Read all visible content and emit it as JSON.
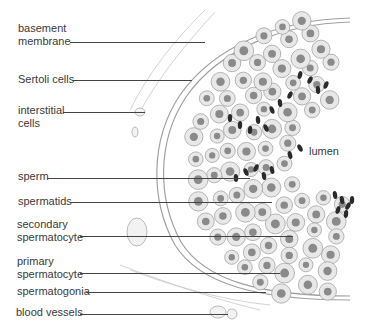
{
  "figure": {
    "labels": [
      {
        "id": "basement-membrane",
        "lines": [
          "basement",
          "membrane"
        ],
        "x": 18,
        "y": 22,
        "line_y": 42,
        "line_x1": 70,
        "line_x2": 205
      },
      {
        "id": "sertoli-cells",
        "lines": [
          "Sertoli cells"
        ],
        "x": 18,
        "y": 73,
        "line_y": 80,
        "line_x1": 72,
        "line_x2": 192
      },
      {
        "id": "interstitial-cells",
        "lines": [
          "interstitial",
          "cells"
        ],
        "x": 18,
        "y": 104,
        "line_y": 112,
        "line_x1": 63,
        "line_x2": 145
      },
      {
        "id": "sperm",
        "lines": [
          "sperm"
        ],
        "x": 18,
        "y": 170,
        "line_y": 178,
        "line_x1": 47,
        "line_x2": 250
      },
      {
        "id": "spermatids",
        "lines": [
          "spermatids"
        ],
        "x": 18,
        "y": 195,
        "line_y": 202,
        "line_x1": 70,
        "line_x2": 272
      },
      {
        "id": "secondary-spermatocyte",
        "lines": [
          "secondary",
          "spermatocyte"
        ],
        "x": 17,
        "y": 218,
        "line_y": 236,
        "line_x1": 80,
        "line_x2": 293
      },
      {
        "id": "primary-spermatocyte",
        "lines": [
          "primary",
          "spermatocyte"
        ],
        "x": 17,
        "y": 255,
        "line_y": 273,
        "line_x1": 80,
        "line_x2": 280
      },
      {
        "id": "spermatogonia",
        "lines": [
          "spermatogonia"
        ],
        "x": 17,
        "y": 285,
        "line_y": 292,
        "line_x1": 86,
        "line_x2": 266
      },
      {
        "id": "blood-vessels",
        "lines": [
          "blood vessels"
        ],
        "x": 16,
        "y": 306,
        "line_y": 314,
        "line_x1": 80,
        "line_x2": 228
      }
    ],
    "lumen_label": "lumen"
  },
  "colors": {
    "text": "#3a3a3a",
    "leader": "#444444",
    "cell_fill": "#e8e8e8",
    "cell_stroke": "#9a9a9a",
    "nucleus": "#8a8a8a",
    "sperm_head": "#2a2a2a"
  }
}
